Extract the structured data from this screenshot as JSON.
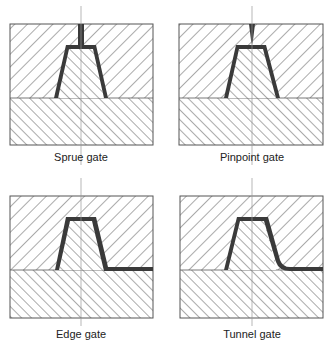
{
  "diagram": {
    "panels": [
      {
        "id": "sprue",
        "label": "Sprue gate"
      },
      {
        "id": "pinpoint",
        "label": "Pinpoint gate"
      },
      {
        "id": "edge",
        "label": "Edge gate"
      },
      {
        "id": "tunnel",
        "label": "Tunnel gate"
      }
    ],
    "colors": {
      "outline": "#555555",
      "hatch": "#444444",
      "part": "#3a3a3a",
      "centerline": "#9a9a9a",
      "background": "#ffffff"
    }
  }
}
